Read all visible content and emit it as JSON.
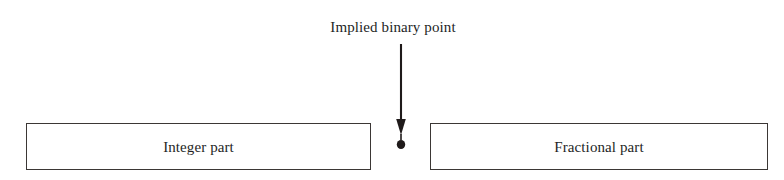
{
  "diagram": {
    "title": "Implied binary point",
    "annotation": {
      "label": "Implied binary point",
      "pointer_icon": "down-arrow-with-dot-icon"
    },
    "boxes": [
      {
        "id": "integer-part",
        "label": "Integer part"
      },
      {
        "id": "fractional-part",
        "label": "Fractional part"
      }
    ],
    "colors": {
      "background": "#ffffff",
      "border": "#3b3735",
      "text": "#241f1f",
      "pointer": "#1f1a1a"
    }
  }
}
